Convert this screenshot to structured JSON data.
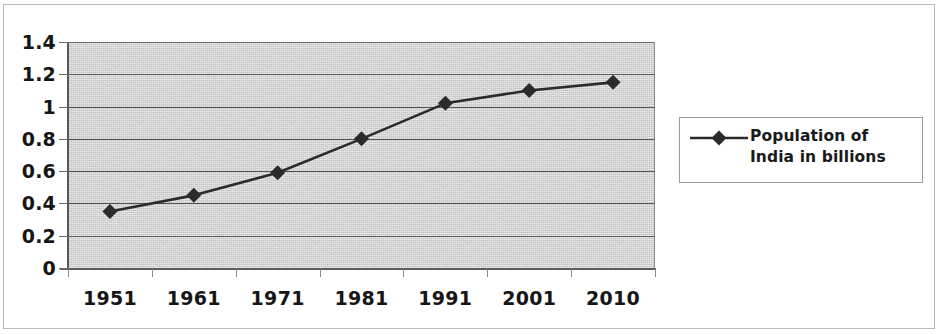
{
  "chart_data": {
    "type": "line",
    "title": "",
    "xlabel": "",
    "ylabel": "",
    "categories": [
      "1951",
      "1961",
      "1971",
      "1981",
      "1991",
      "2001",
      "2010"
    ],
    "series": [
      {
        "name": "Population of India in billions",
        "values": [
          0.35,
          0.45,
          0.59,
          0.8,
          1.02,
          1.1,
          1.15
        ],
        "marker": "diamond",
        "color": "#2b2b2b"
      }
    ],
    "ylim": [
      0,
      1.4
    ],
    "y_ticks": [
      "0",
      "0.2",
      "0.4",
      "0.6",
      "0.8",
      "1",
      "1.2",
      "1.4"
    ],
    "y_tick_values": [
      0,
      0.2,
      0.4,
      0.6,
      0.8,
      1,
      1.2,
      1.4
    ],
    "grid": "horizontal",
    "legend_position": "right",
    "plot_background": "#d7d7d7",
    "gridline_color": "#595959"
  },
  "legend": {
    "label": "Population of India in billions",
    "marker_icon": "diamond-marker-icon"
  },
  "axes": {
    "y_labels": [
      "1.4",
      "1.2",
      "1",
      "0.8",
      "0.6",
      "0.4",
      "0.2",
      "0"
    ],
    "x_labels": [
      "1951",
      "1961",
      "1971",
      "1981",
      "1991",
      "2001",
      "2010"
    ]
  }
}
